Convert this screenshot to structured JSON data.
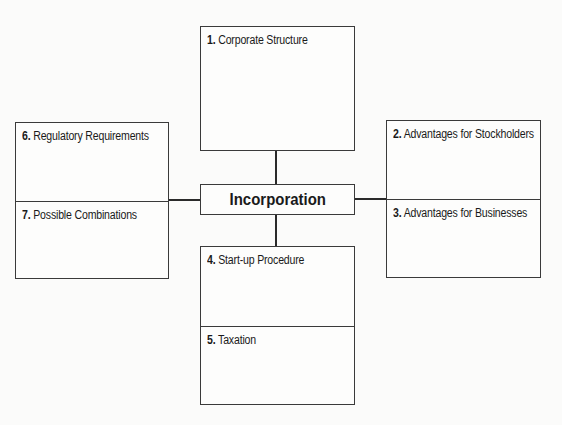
{
  "center": {
    "label": "Incorporation"
  },
  "boxes": {
    "top": {
      "sections": [
        {
          "number": "1.",
          "label": "Corporate Structure"
        }
      ]
    },
    "right": {
      "sections": [
        {
          "number": "2.",
          "label": "Advantages for Stockholders"
        },
        {
          "number": "3.",
          "label": "Advantages for Businesses"
        }
      ]
    },
    "bottom": {
      "sections": [
        {
          "number": "4.",
          "label": "Start-up Procedure"
        },
        {
          "number": "5.",
          "label": "Taxation"
        }
      ]
    },
    "left": {
      "sections": [
        {
          "number": "6.",
          "label": "Regulatory Requirements"
        },
        {
          "number": "7.",
          "label": "Possible Combinations"
        }
      ]
    }
  },
  "colors": {
    "line": "#2a2a2a",
    "background": "#fbfbfa"
  }
}
